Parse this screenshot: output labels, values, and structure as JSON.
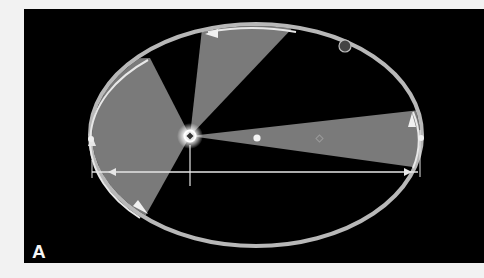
{
  "figure": {
    "panel_label": "A",
    "background_color": "#000000",
    "page_color": "#f2f2f2",
    "orbit": {
      "center": [
        256,
        135
      ],
      "semi_major": 166,
      "semi_minor": 111,
      "color": "#cfcfcf"
    },
    "focus": {
      "position": [
        190,
        136
      ],
      "label_icon": "sun-icon"
    },
    "empty_focus": {
      "position": [
        320,
        139
      ]
    },
    "center_marker": {
      "position": [
        257,
        138
      ]
    },
    "sectors": [
      {
        "name": "sector-left",
        "points": [
          [
            190,
            136
          ],
          [
            150,
            60
          ],
          [
            92,
            100
          ],
          [
            92,
            170
          ],
          [
            138,
            215
          ]
        ],
        "color": "#7a7a7a"
      },
      {
        "name": "sector-top",
        "points": [
          [
            190,
            136
          ],
          [
            205,
            32
          ],
          [
            295,
            34
          ]
        ],
        "color": "#7a7a7a"
      },
      {
        "name": "sector-right",
        "points": [
          [
            190,
            136
          ],
          [
            412,
            112
          ],
          [
            413,
            140
          ],
          [
            412,
            165
          ]
        ],
        "color": "#7a7a7a"
      }
    ],
    "major_axis_line": {
      "from": [
        92,
        172
      ],
      "to": [
        418,
        172
      ]
    },
    "planet": {
      "position": [
        345,
        46
      ],
      "color": "#444444"
    }
  }
}
